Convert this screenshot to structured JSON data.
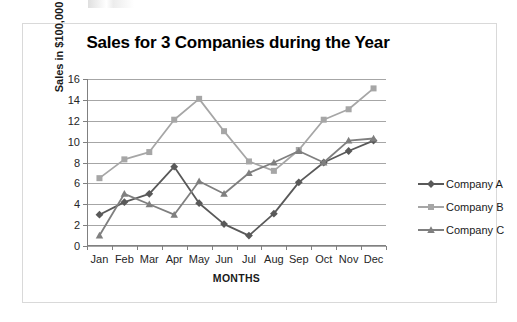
{
  "chart_data": {
    "type": "line",
    "title": "Sales for 3 Companies during the Year",
    "xlabel": "MONTHS",
    "ylabel": "Sales in $100,000",
    "categories": [
      "Jan",
      "Feb",
      "Mar",
      "Apr",
      "May",
      "Jun",
      "Jul",
      "Aug",
      "Sep",
      "Oct",
      "Nov",
      "Dec"
    ],
    "ylim": [
      0,
      16
    ],
    "yticks": [
      0,
      2,
      4,
      6,
      8,
      10,
      12,
      14,
      16
    ],
    "grid": true,
    "legend_position": "right",
    "series": [
      {
        "name": "Company A",
        "color": "#595959",
        "marker": "diamond",
        "values": [
          3.0,
          4.2,
          5.0,
          7.6,
          4.1,
          2.1,
          1.0,
          3.1,
          6.1,
          8.0,
          9.1,
          10.1
        ]
      },
      {
        "name": "Company B",
        "color": "#a6a6a6",
        "marker": "square",
        "values": [
          6.5,
          8.3,
          9.0,
          12.1,
          14.1,
          11.0,
          8.1,
          7.2,
          9.2,
          12.1,
          13.1,
          15.1
        ]
      },
      {
        "name": "Company C",
        "color": "#7f7f7f",
        "marker": "triangle",
        "values": [
          1.0,
          5.0,
          4.0,
          3.0,
          6.2,
          5.0,
          7.0,
          8.0,
          9.1,
          8.0,
          10.1,
          10.3
        ]
      }
    ]
  },
  "frame": {
    "border_color": "#d9d9d9",
    "background": "#ffffff"
  }
}
